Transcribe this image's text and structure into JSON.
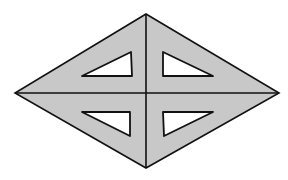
{
  "figure": {
    "colors": {
      "background": "#ffffff",
      "fill": "#c8c8c8",
      "stroke": "#111111",
      "hole": "#ffffff"
    },
    "rhombus": {
      "top": [
        146,
        14
      ],
      "right": [
        279,
        93
      ],
      "bottom": [
        146,
        168
      ],
      "left": [
        15,
        93
      ]
    },
    "center": [
      146,
      93
    ],
    "holes": [
      {
        "name": "upper-left",
        "points": [
          [
            82,
            76
          ],
          [
            131,
            52
          ],
          [
            132,
            76
          ]
        ]
      },
      {
        "name": "upper-right",
        "points": [
          [
            163,
            52
          ],
          [
            213,
            76
          ],
          [
            163,
            76
          ]
        ]
      },
      {
        "name": "lower-left",
        "points": [
          [
            82,
            112
          ],
          [
            130,
            112
          ],
          [
            130,
            136
          ]
        ]
      },
      {
        "name": "lower-right",
        "points": [
          [
            163,
            112
          ],
          [
            213,
            112
          ],
          [
            164,
            136
          ]
        ]
      }
    ]
  }
}
